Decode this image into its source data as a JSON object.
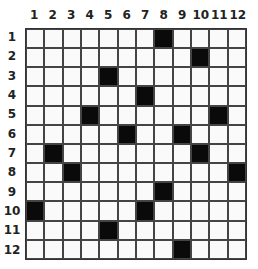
{
  "puzzle": {
    "rows": 12,
    "cols": 12,
    "col_labels": [
      "1",
      "2",
      "3",
      "4",
      "5",
      "6",
      "7",
      "8",
      "9",
      "10",
      "11",
      "12"
    ],
    "row_labels": [
      "1",
      "2",
      "3",
      "4",
      "5",
      "6",
      "7",
      "8",
      "9",
      "10",
      "11",
      "12"
    ],
    "black_cells": [
      [
        1,
        8
      ],
      [
        2,
        10
      ],
      [
        3,
        5
      ],
      [
        4,
        7
      ],
      [
        5,
        4
      ],
      [
        5,
        11
      ],
      [
        6,
        6
      ],
      [
        6,
        9
      ],
      [
        7,
        2
      ],
      [
        7,
        10
      ],
      [
        8,
        3
      ],
      [
        8,
        12
      ],
      [
        9,
        8
      ],
      [
        10,
        1
      ],
      [
        10,
        7
      ],
      [
        11,
        5
      ],
      [
        12,
        9
      ]
    ],
    "colors": {
      "black": "#0a0a0a",
      "white": "#fafafa",
      "line": "#444444"
    }
  }
}
